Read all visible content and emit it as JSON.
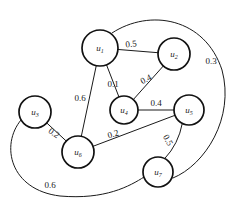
{
  "figure": {
    "type": "weighted-undirected-graph",
    "background_color": "#ffffff",
    "stroke_color": "#1a1a1a",
    "width": 234,
    "height": 204
  },
  "chart_data": {
    "type": "diagram",
    "title": "",
    "xlabel": "",
    "ylabel": "",
    "nodes": [
      {
        "id": "u1",
        "label": "u",
        "sub": "1",
        "x": 100,
        "y": 48,
        "r": 18
      },
      {
        "id": "u2",
        "label": "u",
        "sub": "2",
        "x": 174,
        "y": 54,
        "r": 16
      },
      {
        "id": "u3",
        "label": "u",
        "sub": "3",
        "x": 35,
        "y": 112,
        "r": 16
      },
      {
        "id": "u4",
        "label": "u",
        "sub": "4",
        "x": 124,
        "y": 110,
        "r": 14
      },
      {
        "id": "u5",
        "label": "u",
        "sub": "5",
        "x": 189,
        "y": 110,
        "r": 15
      },
      {
        "id": "u6",
        "label": "u",
        "sub": "6",
        "x": 78,
        "y": 152,
        "r": 16
      },
      {
        "id": "u7",
        "label": "u",
        "sub": "7",
        "x": 158,
        "y": 172,
        "r": 15
      }
    ],
    "edges": [
      {
        "from": "u1",
        "to": "u2",
        "weight": "0.5",
        "label_x": 131,
        "label_y": 44,
        "rotate": -6,
        "curve": null
      },
      {
        "from": "u2",
        "to": "u4",
        "weight": "0.4",
        "label_x": 146,
        "label_y": 79,
        "rotate": -27,
        "curve": null
      },
      {
        "from": "u1",
        "to": "u4",
        "weight": "0.1",
        "label_x": 113,
        "label_y": 84,
        "rotate": 0,
        "curve": null
      },
      {
        "from": "u1",
        "to": "u6",
        "weight": "0.6",
        "label_x": 80,
        "label_y": 98,
        "rotate": 0,
        "curve": null
      },
      {
        "from": "u4",
        "to": "u5",
        "weight": "0.4",
        "label_x": 156,
        "label_y": 103,
        "rotate": 0,
        "curve": null
      },
      {
        "from": "u6",
        "to": "u5",
        "weight": "0.2",
        "label_x": 113,
        "label_y": 134,
        "rotate": -16,
        "curve": null
      },
      {
        "from": "u3",
        "to": "u6",
        "weight": "0.2",
        "label_x": 54,
        "label_y": 133,
        "rotate": 35,
        "curve": null
      },
      {
        "from": "u5",
        "to": "u7",
        "weight": "0.5",
        "label_x": 168,
        "label_y": 140,
        "rotate": 62,
        "curve": "slight"
      },
      {
        "from": "u1",
        "to": "u7",
        "weight": "0.3",
        "label_x": 211,
        "label_y": 61,
        "rotate": 0,
        "curve": "large-right-arc"
      },
      {
        "from": "u3",
        "to": "u7",
        "weight": "0.6",
        "label_x": 50,
        "label_y": 185,
        "rotate": 0,
        "curve": "large-bottom-arc"
      }
    ],
    "legend": [],
    "annotations": []
  }
}
